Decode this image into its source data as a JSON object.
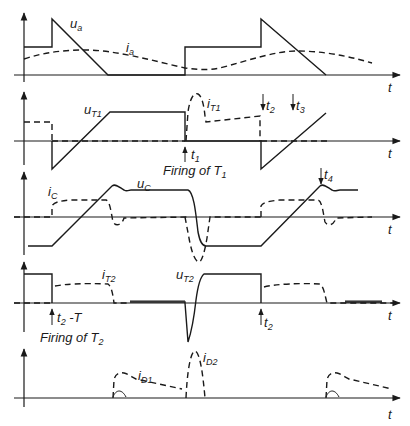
{
  "diagram": {
    "type": "waveform-timing-diagram",
    "time_axis_label": "t",
    "panels": [
      {
        "id": "panel-1",
        "signals": [
          {
            "name": "u_a",
            "label_main": "u",
            "label_sub": "a",
            "style": "solid"
          },
          {
            "name": "i_a",
            "label_main": "i",
            "label_sub": "a",
            "style": "dashed"
          }
        ]
      },
      {
        "id": "panel-2",
        "signals": [
          {
            "name": "u_T1",
            "label_main": "u",
            "label_sub": "T1",
            "style": "solid"
          },
          {
            "name": "i_T1",
            "label_main": "i",
            "label_sub": "T1",
            "style": "dashed"
          }
        ],
        "markers": [
          {
            "label_main": "t",
            "label_sub": "1",
            "direction": "up"
          },
          {
            "label_main": "t",
            "label_sub": "2",
            "direction": "down"
          },
          {
            "label_main": "t",
            "label_sub": "3",
            "direction": "down"
          }
        ],
        "annotation": {
          "text_main": "Firing of T",
          "text_sub": "1"
        }
      },
      {
        "id": "panel-3",
        "signals": [
          {
            "name": "u_C",
            "label_main": "u",
            "label_sub": "C",
            "style": "solid"
          },
          {
            "name": "i_C",
            "label_main": "i",
            "label_sub": "C",
            "style": "dashed"
          }
        ],
        "markers": [
          {
            "label_main": "t",
            "label_sub": "4",
            "direction": "down"
          }
        ]
      },
      {
        "id": "panel-4",
        "signals": [
          {
            "name": "u_T2",
            "label_main": "u",
            "label_sub": "T2",
            "style": "solid"
          },
          {
            "name": "i_T2",
            "label_main": "i",
            "label_sub": "T2",
            "style": "dashed"
          }
        ],
        "markers": [
          {
            "label_main": "t",
            "label_sub": "2",
            "label_suffix": " -T",
            "direction": "up"
          },
          {
            "label_main": "t",
            "label_sub": "2",
            "direction": "up"
          }
        ],
        "annotation": {
          "text_main": "Firing of T",
          "text_sub": "2"
        }
      },
      {
        "id": "panel-5",
        "signals": [
          {
            "name": "i_D1",
            "label_main": "i",
            "label_sub": "D1",
            "style": "dashed"
          },
          {
            "name": "i_D2",
            "label_main": "i",
            "label_sub": "D2",
            "style": "dashed"
          }
        ]
      }
    ],
    "colors": {
      "ink": "#1a1a1a",
      "background": "#ffffff"
    }
  }
}
